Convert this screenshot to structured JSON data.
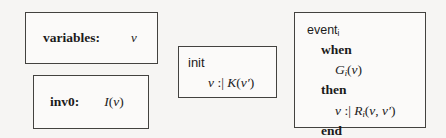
{
  "figure": {
    "kind": "event-b-machine-skeleton",
    "background_color": "#f6f5f3",
    "border_color": "#43423f"
  },
  "variables_box": {
    "keyword": "variables:",
    "value": "v"
  },
  "invariant_box": {
    "keyword": "inv0:",
    "value_name": "I",
    "value_open": "(",
    "value_arg": "v",
    "value_close": ")"
  },
  "init_box": {
    "keyword": "init",
    "body": {
      "lhs": "v",
      "operator": ":|",
      "predicate_name": "K",
      "open": "(",
      "arg": "v",
      "prime": "′",
      "close": ")"
    }
  },
  "event_box": {
    "header": {
      "keyword": "event",
      "subscript": "i"
    },
    "when_keyword": "when",
    "guard": {
      "name": "G",
      "subscript": "i",
      "open": "(",
      "arg": "v",
      "close": ")"
    },
    "then_keyword": "then",
    "action": {
      "lhs": "v",
      "operator": ":|",
      "name": "R",
      "subscript": "i",
      "open": "(",
      "arg1": "v",
      "comma": ",",
      "arg2": "v",
      "prime": "′",
      "close": ")"
    },
    "end_keyword": "end"
  }
}
